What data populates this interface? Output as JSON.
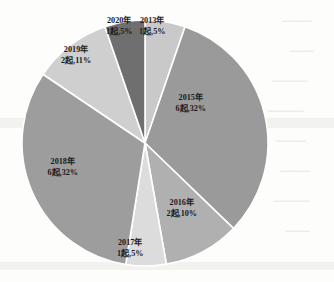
{
  "chart_data": {
    "type": "pie",
    "title": "",
    "subtitle": "",
    "unit_label": "起",
    "legend_position": "none",
    "labels_inside": true,
    "total_count": 19,
    "categories": [
      "2013年",
      "2015年",
      "2016年",
      "2017年",
      "2018年",
      "2019年",
      "2020年"
    ],
    "values": [
      1,
      6,
      2,
      1,
      6,
      2,
      1
    ],
    "percent_labels": [
      "5%",
      "32%",
      "10%",
      "5%",
      "32%",
      "11%",
      "5%"
    ],
    "percents": [
      5,
      32,
      10,
      5,
      32,
      11,
      5
    ],
    "slice_colors": [
      "#c9c9c9",
      "#9a9a9a",
      "#b0b0b0",
      "#dcdcdc",
      "#9d9d9d",
      "#cfcfcf",
      "#6f6f6f"
    ],
    "slices": [
      {
        "name": "2013年",
        "count_text": "1起",
        "percent_text": "5%",
        "label_line1": "2013年",
        "label_line2": "1起,5%",
        "value": 1,
        "percent": 5,
        "color": "#c9c9c9",
        "start_angle": 0,
        "end_angle": 19,
        "label_x": 152,
        "label_y": 16
      },
      {
        "name": "2015年",
        "count_text": "6起",
        "percent_text": "32%",
        "label_line1": "2015年",
        "label_line2": "6起,32%",
        "value": 6,
        "percent": 32,
        "color": "#9a9a9a",
        "start_angle": 19,
        "end_angle": 134,
        "label_x": 191,
        "label_y": 93
      },
      {
        "name": "2016年",
        "count_text": "2起",
        "percent_text": "10%",
        "label_line1": "2016年",
        "label_line2": "2起,10%",
        "value": 2,
        "percent": 10,
        "color": "#b0b0b0",
        "start_angle": 134,
        "end_angle": 170,
        "label_x": 182,
        "label_y": 198
      },
      {
        "name": "2017年",
        "count_text": "1起",
        "percent_text": "5%",
        "label_line1": "2017年",
        "label_line2": "1起,5%",
        "value": 1,
        "percent": 5,
        "color": "#dcdcdc",
        "start_angle": 170,
        "end_angle": 189,
        "label_x": 130,
        "label_y": 238
      },
      {
        "name": "2018年",
        "count_text": "6起",
        "percent_text": "32%",
        "label_line1": "2018年",
        "label_line2": "6起,32%",
        "value": 6,
        "percent": 32,
        "color": "#9d9d9d",
        "start_angle": 189,
        "end_angle": 304,
        "label_x": 63,
        "label_y": 157
      },
      {
        "name": "2019年",
        "count_text": "2起",
        "percent_text": "11%",
        "label_line1": "2019年",
        "label_line2": "2起,11%",
        "value": 2,
        "percent": 11,
        "color": "#cfcfcf",
        "start_angle": 304,
        "end_angle": 341,
        "label_x": 76,
        "label_y": 45
      },
      {
        "name": "2020年",
        "count_text": "1起",
        "percent_text": "5%",
        "label_line1": "2020年",
        "label_line2": "1起,5%",
        "value": 1,
        "percent": 5,
        "color": "#6f6f6f",
        "start_angle": 341,
        "end_angle": 360,
        "label_x": 119,
        "label_y": 16
      }
    ],
    "geometry": {
      "center_x": 145,
      "center_y": 143,
      "radius": 123,
      "separator_color": "#ffffff",
      "separator_width": 1.6
    }
  }
}
